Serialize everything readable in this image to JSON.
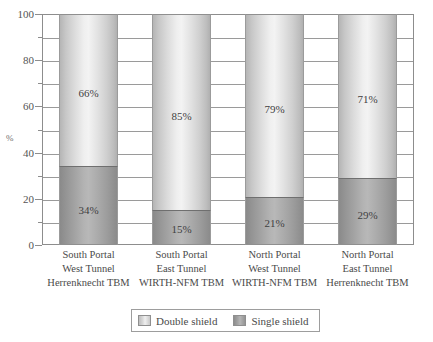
{
  "chart_data": {
    "type": "bar",
    "subtype": "stacked-100-percent",
    "title": "",
    "xlabel": "",
    "ylabel": "%",
    "ylim": [
      0,
      100
    ],
    "y_major_step": 20,
    "y_minor_step": 10,
    "grid": true,
    "grid_step": 10,
    "legend_position": "bottom-center",
    "categories": [
      "South Portal West Tunnel Herrenknecht TBM",
      "South Portal East Tunnel WIRTH-NFM TBM",
      "North Portal West Tunnel WIRTH-NFM TBM",
      "North Portal East Tunnel Herrenknecht TBM"
    ],
    "category_lines": [
      [
        "South Portal",
        "West Tunnel",
        "Herrenknecht TBM"
      ],
      [
        "South Portal",
        "East Tunnel",
        "WIRTH-NFM TBM"
      ],
      [
        "North Portal",
        "West Tunnel",
        "WIRTH-NFM TBM"
      ],
      [
        "North Portal",
        "East Tunnel",
        "Herrenknecht TBM"
      ]
    ],
    "series": [
      {
        "name": "Double shield",
        "values": [
          66,
          85,
          79,
          71
        ],
        "labels": [
          "66%",
          "85%",
          "79%",
          "71%"
        ],
        "color": "#dcdcdc"
      },
      {
        "name": "Single shield",
        "values": [
          34,
          15,
          21,
          29
        ],
        "labels": [
          "34%",
          "15%",
          "21%",
          "29%"
        ],
        "color": "#a0a0a0"
      }
    ],
    "y_ticks": [
      {
        "value": 0,
        "label": "0",
        "major": true
      },
      {
        "value": 10,
        "label": "",
        "major": false
      },
      {
        "value": 20,
        "label": "20",
        "major": true
      },
      {
        "value": 30,
        "label": "",
        "major": false
      },
      {
        "value": 40,
        "label": "40",
        "major": true
      },
      {
        "value": 50,
        "label": "",
        "major": false
      },
      {
        "value": 60,
        "label": "60",
        "major": true
      },
      {
        "value": 70,
        "label": "",
        "major": false
      },
      {
        "value": 80,
        "label": "80",
        "major": true
      },
      {
        "value": 90,
        "label": "",
        "major": false
      },
      {
        "value": 100,
        "label": "100",
        "major": true
      }
    ]
  },
  "axis": {
    "y_title": "%",
    "y_labels": [
      "100",
      "80",
      "60",
      "40",
      "20",
      "0"
    ]
  },
  "legend": {
    "items": [
      {
        "label": "Double shield",
        "swatch": "double-shield-swatch"
      },
      {
        "label": "Single shield",
        "swatch": "single-shield-swatch"
      }
    ]
  },
  "bars": [
    {
      "category_line1": "South Portal",
      "category_line2": "West Tunnel",
      "category_line3": "Herrenknecht TBM",
      "top_label": "66%",
      "bottom_label": "34%",
      "top_value": 66,
      "bottom_value": 34
    },
    {
      "category_line1": "South Portal",
      "category_line2": "East Tunnel",
      "category_line3": "WIRTH-NFM TBM",
      "top_label": "85%",
      "bottom_label": "15%",
      "top_value": 85,
      "bottom_value": 15
    },
    {
      "category_line1": "North Portal",
      "category_line2": "West Tunnel",
      "category_line3": "WIRTH-NFM TBM",
      "top_label": "79%",
      "bottom_label": "21%",
      "top_value": 79,
      "bottom_value": 21
    },
    {
      "category_line1": "North Portal",
      "category_line2": "East Tunnel",
      "category_line3": "Herrenknecht TBM",
      "top_label": "71%",
      "bottom_label": "29%",
      "top_value": 71,
      "bottom_value": 29
    }
  ]
}
